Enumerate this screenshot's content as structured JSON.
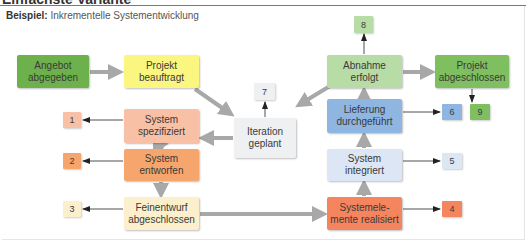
{
  "heading": "Einfachste Variante",
  "caption": {
    "label": "Beispiel:",
    "text": "Inkrementelle Systementwicklung"
  },
  "nodes": {
    "angebot": {
      "label": "Angebot\nabgegeben",
      "color": "#6db14c"
    },
    "beauftragt": {
      "label": "Projekt\nbeauftragt",
      "color": "#fbf67f"
    },
    "spezifiziert": {
      "label": "System\nspezifiziert",
      "color": "#f8c1a5"
    },
    "entworfen": {
      "label": "System\nentworfen",
      "color": "#f6a66c"
    },
    "feinentwurf": {
      "label": "Feinentwurf\nabgeschlossen",
      "color": "#fbf0cb"
    },
    "iteration": {
      "label": "Iteration\ngeplant",
      "color": "#eef0f1"
    },
    "abnahme": {
      "label": "Abnahme\nerfolgt",
      "color": "#b8dca6"
    },
    "abgeschlossen": {
      "label": "Projekt\nabgeschlossen",
      "color": "#7fbf5f"
    },
    "lieferung": {
      "label": "Lieferung\ndurchgeführt",
      "color": "#8fb5e1"
    },
    "integriert": {
      "label": "System\nintegriert",
      "color": "#dce6f4"
    },
    "realisiert": {
      "label": "Systemele-\nmente realisiert",
      "color": "#f5855f"
    }
  },
  "numbers": {
    "n1": {
      "label": "1",
      "color": "#f8c1a5"
    },
    "n2": {
      "label": "2",
      "color": "#f6a66c"
    },
    "n3": {
      "label": "3",
      "color": "#fbf0cb"
    },
    "n4": {
      "label": "4",
      "color": "#f5855f"
    },
    "n5": {
      "label": "5",
      "color": "#dce6f4"
    },
    "n6": {
      "label": "6",
      "color": "#8fb5e1"
    },
    "n7": {
      "label": "7",
      "color": "#eef0f1"
    },
    "n8": {
      "label": "8",
      "color": "#b8dca6"
    },
    "n9": {
      "label": "9",
      "color": "#7fbf5f"
    }
  },
  "colors": {
    "flow_arrow": "#a8a8a8",
    "output_arrow": "#222222",
    "rule": "#6f7a86"
  }
}
